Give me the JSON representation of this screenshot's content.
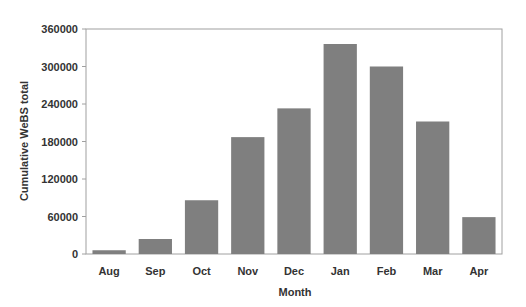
{
  "chart_data": {
    "type": "bar",
    "title": "",
    "xlabel": "Month",
    "ylabel": "Cumulative WeBS total",
    "categories": [
      "Aug",
      "Sep",
      "Oct",
      "Nov",
      "Dec",
      "Jan",
      "Feb",
      "Mar",
      "Apr"
    ],
    "values": [
      6000,
      24000,
      86000,
      187000,
      233000,
      336000,
      300000,
      212000,
      59000
    ],
    "ylim": [
      0,
      360000
    ],
    "yticks": [
      0,
      60000,
      120000,
      180000,
      240000,
      300000,
      360000
    ],
    "ytick_labels": [
      "0",
      "60000",
      "120000",
      "180000",
      "240000",
      "300000",
      "360000"
    ],
    "grid": false,
    "legend": null,
    "colors": {
      "bar": "#7f7f7f",
      "frame": "#a0a0a0",
      "text": "#333333"
    }
  }
}
